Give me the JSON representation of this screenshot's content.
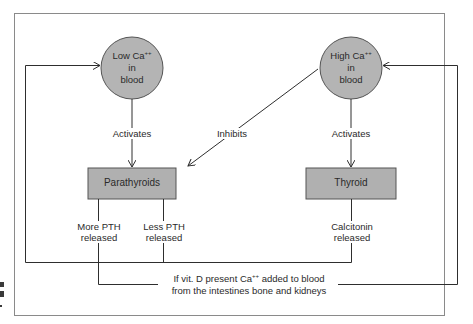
{
  "diagram": {
    "nodes": {
      "low_ca": {
        "line1": "Low Ca",
        "sup": "++",
        "line2": "in",
        "line3": "blood"
      },
      "high_ca": {
        "line1": "High Ca",
        "sup": "++",
        "line2": "in",
        "line3": "blood"
      },
      "parathyroids": {
        "label": "Parathyroids"
      },
      "thyroid": {
        "label": "Thyroid"
      }
    },
    "edges": {
      "low_activates": "Activates",
      "high_activates": "Activates",
      "inhibits": "Inhibits",
      "more_pth": {
        "line1": "More PTH",
        "line2": "released"
      },
      "less_pth": {
        "line1": "Less PTH",
        "line2": "released"
      },
      "calcitonin": {
        "line1": "Calcitonin",
        "line2": "released"
      },
      "vitd": {
        "line1a": "If vit. D present Ca",
        "sup": "++",
        "line1b": " added to blood",
        "line2": "from the intestines bone and kidneys"
      }
    },
    "colors": {
      "node_fill": "#b4b4b4",
      "box_fill": "#b0b0b0",
      "stroke": "#2e2e2e",
      "frame": "#8a8a8a"
    }
  }
}
